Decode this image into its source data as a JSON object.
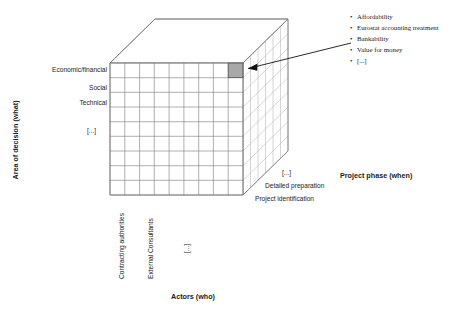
{
  "diagram": {
    "axes": {
      "y": {
        "title": "Area of decision (what)",
        "labels": [
          "Economic/financial",
          "Social",
          "Technical",
          "[...]"
        ]
      },
      "x": {
        "title": "Actors (who)",
        "labels": [
          "Contracting authorities",
          "External Consultants",
          "[...]"
        ]
      },
      "z": {
        "title": "Project phase (when)",
        "labels": [
          "Project identification",
          "Detailed preparation",
          "[...]"
        ]
      }
    },
    "callout": {
      "bullet_char": "•",
      "items": [
        "Affordability",
        "Eurostat accounting treatment",
        "Bankability",
        "Value for money",
        "[...]"
      ]
    },
    "highlighted_cell": {
      "name": "highlighted-cell",
      "color": "#a8a8a8"
    },
    "grid": {
      "front_columns": 9,
      "front_rows": 9,
      "depth_columns": 6
    },
    "colors": {
      "grid": "#8c8c8c",
      "edge": "#6e6e6e",
      "highlight": "#a8a8a8",
      "arrow": "#111111",
      "text": "#1a1a1a"
    }
  }
}
